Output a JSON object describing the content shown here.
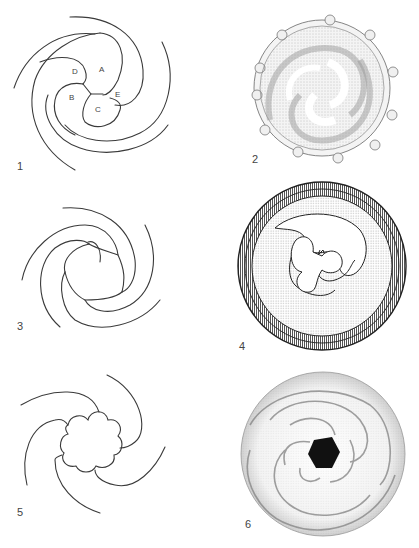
{
  "figure": {
    "panels": [
      {
        "number": "1",
        "kind": "line-diagram",
        "labels": [
          "A",
          "B",
          "C",
          "D",
          "E"
        ],
        "arms": 4
      },
      {
        "number": "2",
        "kind": "stippled-drawing",
        "description": "spiral with knobbed rim"
      },
      {
        "number": "3",
        "kind": "line-diagram",
        "arms": 4,
        "description": "open central ring"
      },
      {
        "number": "4",
        "kind": "hatched-drawing",
        "description": "four-lobed spiral in circular disc"
      },
      {
        "number": "5",
        "kind": "line-diagram",
        "arms": 4,
        "description": "lobed central body"
      },
      {
        "number": "6",
        "kind": "stippled-drawing",
        "description": "spiral disc with dark pentagonal center"
      }
    ],
    "labels": {
      "A": "A",
      "B": "B",
      "C": "C",
      "D": "D",
      "E": "E"
    }
  }
}
